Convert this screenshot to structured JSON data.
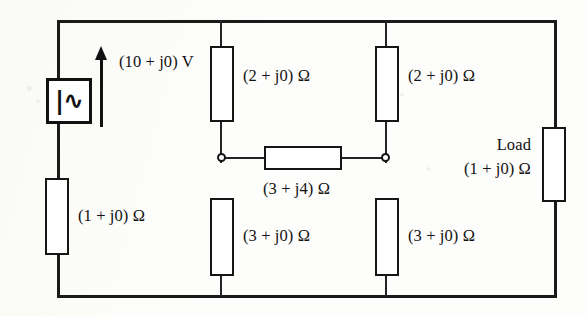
{
  "diagram": {
    "source": {
      "name": "ac-voltage-source",
      "glyph": "|∿",
      "glyph_name": "ac-source-symbol",
      "voltage_label": "(10 + j0) V",
      "arrow_name": "voltage-polarity-arrow"
    },
    "components": {
      "series_left": {
        "label": "(1 + j0) Ω",
        "name": "resistor-series-left"
      },
      "top_left_shunt": {
        "label": "(2 + j0) Ω",
        "name": "resistor-top-left"
      },
      "top_right_shunt": {
        "label": "(2 + j0) Ω",
        "name": "resistor-top-right"
      },
      "bottom_left_shunt": {
        "label": "(3 + j0) Ω",
        "name": "resistor-bottom-left"
      },
      "bottom_right_shunt": {
        "label": "(3 + j0) Ω",
        "name": "resistor-bottom-right"
      },
      "bridge": {
        "label": "(3 + j4) Ω",
        "name": "resistor-bridge"
      },
      "load": {
        "title": "Load",
        "label": "(1 + j0) Ω",
        "name": "resistor-load"
      }
    },
    "colors": {
      "wire": "#1a1a1a",
      "component_outline": "#161616",
      "component_fill": "#ffffff",
      "background": "#fdfdfb",
      "text": "#121212"
    }
  }
}
